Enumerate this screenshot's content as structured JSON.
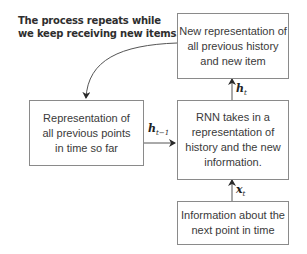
{
  "annotation": {
    "lines": [
      "The process repeats while",
      "we keep receiving new items."
    ]
  },
  "boxes": {
    "new_representation": {
      "lines": [
        "New representation of",
        "all previous history",
        "and new item"
      ]
    },
    "previous_points": {
      "lines": [
        "Representation of",
        "all previous points",
        "in time so far"
      ]
    },
    "rnn": {
      "lines": [
        "RNN takes in a",
        "representation of",
        "history and the new",
        "information."
      ]
    },
    "next_point": {
      "lines": [
        "Information about the",
        "next point in time"
      ]
    }
  },
  "labels": {
    "h_t": {
      "base": "h",
      "sub": "t"
    },
    "h_t_minus_1": {
      "base": "h",
      "sub": "t−1"
    },
    "x_t": {
      "base": "x",
      "sub": "t"
    }
  },
  "colors": {
    "border": "#8a8a8a",
    "arrow": "#3a3a3a",
    "text": "#3a3a3a"
  }
}
